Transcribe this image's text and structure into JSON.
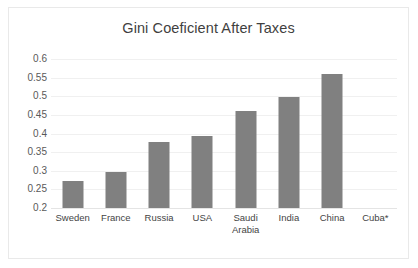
{
  "chart_data": {
    "type": "bar",
    "title": "Gini Coeficient After Taxes",
    "xlabel": "",
    "ylabel": "",
    "ylim": [
      0.2,
      0.6
    ],
    "ytick_step": 0.05,
    "yticks": [
      "0.6",
      "0.55",
      "0.5",
      "0.45",
      "0.4",
      "0.35",
      "0.3",
      "0.25",
      "0.2"
    ],
    "grid": true,
    "legend": "none",
    "bar_color": "#808080",
    "gridline_color": "#f0f0f0",
    "border_color": "#e9e9e9",
    "categories": [
      "Sweden",
      "France",
      "Russia",
      "USA",
      "Saudi Arabia",
      "India",
      "China",
      "Cuba*"
    ],
    "category_lines": [
      [
        "Sweden"
      ],
      [
        "France"
      ],
      [
        "Russia"
      ],
      [
        "USA"
      ],
      [
        "Saudi",
        "Arabia"
      ],
      [
        "India"
      ],
      [
        "China"
      ],
      [
        "Cuba*"
      ]
    ],
    "values": [
      0.273,
      0.298,
      0.378,
      0.393,
      0.461,
      0.497,
      0.56,
      null
    ]
  }
}
